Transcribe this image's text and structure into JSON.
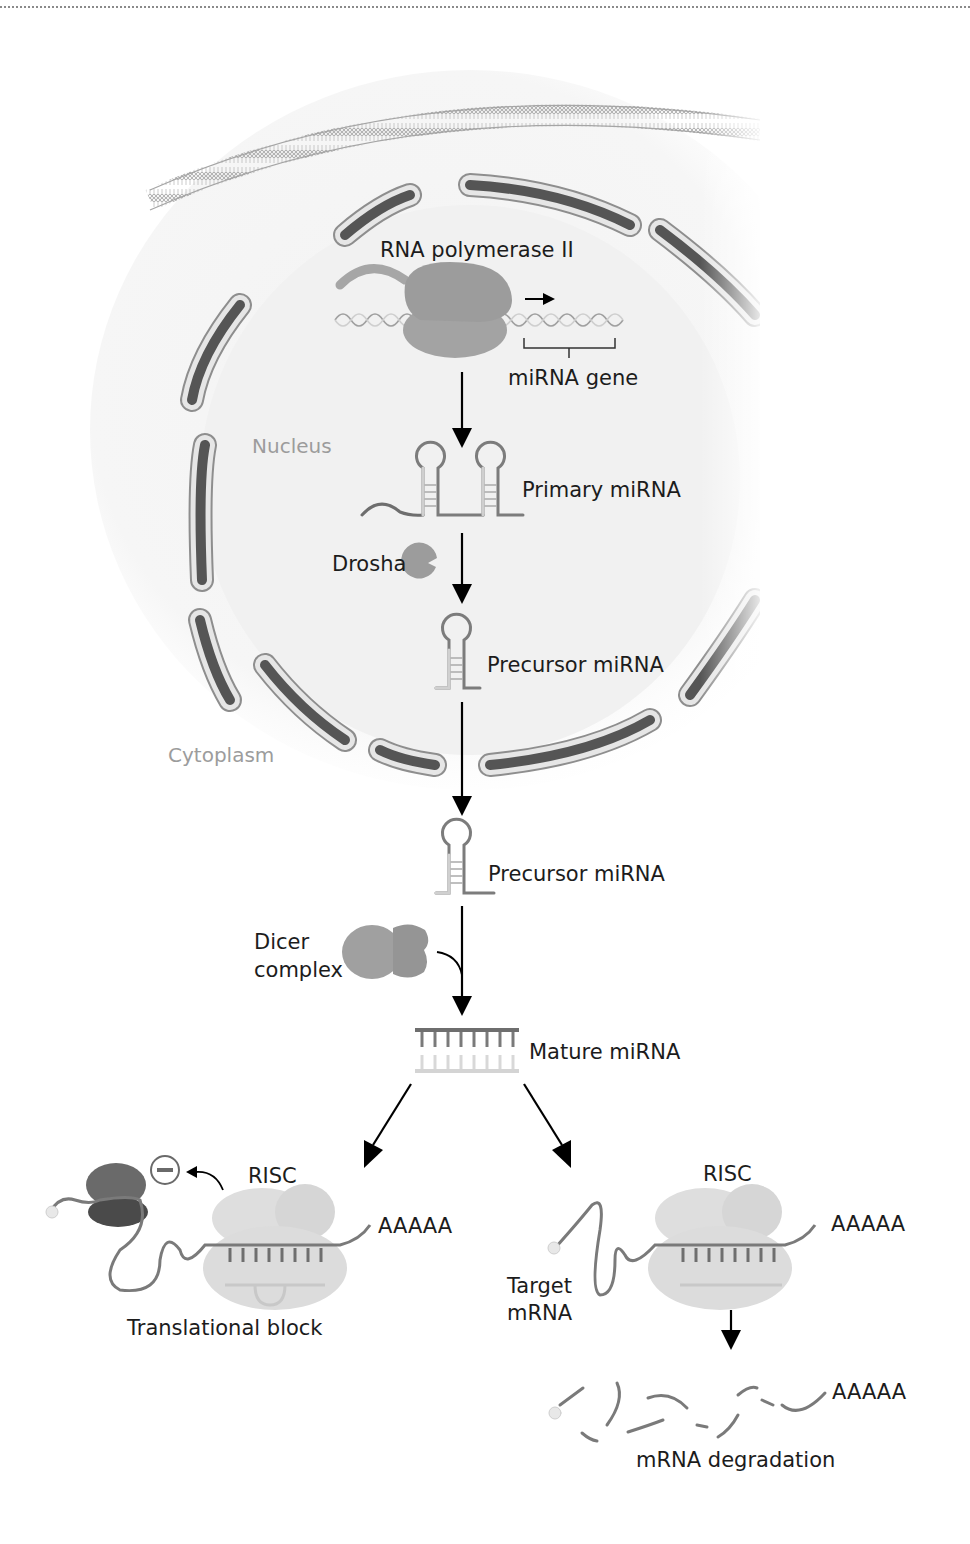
{
  "diagram": {
    "regions": {
      "nucleus": "Nucleus",
      "cytoplasm": "Cytoplasm"
    },
    "labels": {
      "rna_polymerase": "RNA polymerase II",
      "mirna_gene": "miRNA gene",
      "primary_mirna": "Primary miRNA",
      "drosha": "Drosha",
      "precursor_nucleus": "Precursor miRNA",
      "precursor_cytoplasm": "Precursor miRNA",
      "dicer_line1": "Dicer",
      "dicer_line2": "complex",
      "mature_mirna": "Mature miRNA",
      "risc_left": "RISC",
      "risc_right": "RISC",
      "polya_left": "AAAAA",
      "polya_right": "AAAAA",
      "polya_degraded": "AAAAA",
      "translational_block": "Translational block",
      "target_line1": "Target",
      "target_line2": "mRNA",
      "mrna_degradation": "mRNA degradation"
    },
    "colors": {
      "membrane": "#a9a9a9",
      "nuclear_envelope_outer": "#d9d9d9",
      "nuclear_envelope_inner": "#555555",
      "protein": "#9a9a9a",
      "risc": "#dcdcdc",
      "rna_dark": "#6e6e6e",
      "rna_light": "#cfcfcf",
      "arrow": "#000000",
      "ribosome": "#5a5a5a"
    }
  }
}
